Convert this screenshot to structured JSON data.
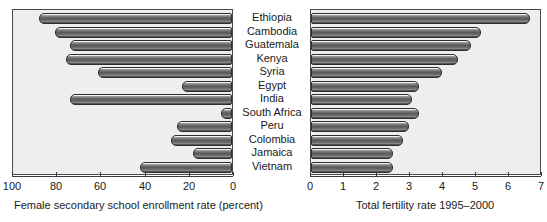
{
  "chart_data": {
    "type": "bar",
    "title": "",
    "orientation": "horizontal",
    "layout": "two-panel-paired-horizontal-bar",
    "categories": [
      "Ethiopia",
      "Cambodia",
      "Guatemala",
      "Kenya",
      "Syria",
      "Egypt",
      "India",
      "South Africa",
      "Peru",
      "Colombia",
      "Jamaica",
      "Vietnam"
    ],
    "panels": [
      {
        "name": "female-enrollment",
        "position": "left",
        "xlabel": "Female secondary school enrollment rate (percent)",
        "ylabel": "",
        "xlim": [
          100,
          0
        ],
        "reversed": true,
        "ticks": [
          100,
          80,
          60,
          40,
          20,
          0
        ],
        "tick_labels": [
          "100",
          "80",
          "60",
          "40",
          "20",
          "0"
        ],
        "grid": false,
        "values": [
          12,
          19,
          26,
          24,
          39,
          77,
          26,
          95,
          75,
          72,
          82,
          58
        ]
      },
      {
        "name": "total-fertility-rate",
        "position": "right",
        "xlabel": "Total fertility rate 1995–2000",
        "ylabel": "",
        "xlim": [
          0,
          7
        ],
        "reversed": false,
        "ticks": [
          0,
          1,
          2,
          3,
          4,
          5,
          6,
          7
        ],
        "tick_labels": [
          "0",
          "1",
          "2",
          "3",
          "4",
          "5",
          "6",
          "7"
        ],
        "grid": false,
        "values": [
          6.7,
          5.2,
          4.9,
          4.5,
          4.0,
          3.3,
          3.1,
          3.3,
          3.0,
          2.8,
          2.5,
          2.5
        ]
      }
    ],
    "colors": {
      "bar_fill": "#6e6e6e",
      "bar_edge": "#2e2e2e",
      "panel_background": "#eeeeee",
      "panel_border": "#4a4a4a",
      "text": "#1a1a1a",
      "page_background": "#ffffff"
    }
  }
}
